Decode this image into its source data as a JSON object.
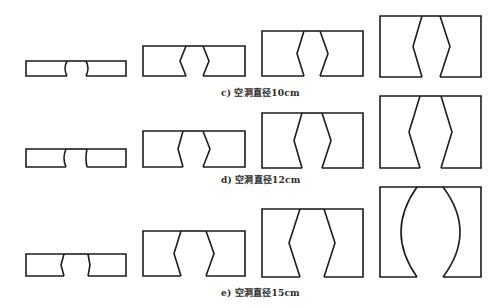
{
  "figure": {
    "stroke_color": "#1c1c1c",
    "background": "#ffffff",
    "rows": [
      {
        "id": "c",
        "caption": "c) 空洞直径10cm",
        "caption_pos": {
          "x": 221,
          "y": 87
        },
        "shapes": [
          {
            "x1": 26,
            "x2": 126,
            "top": 61,
            "bottom": 76,
            "left_gap": [
              67,
              65,
              67
            ],
            "right_gap": [
              86,
              88,
              86
            ],
            "curved": true
          },
          {
            "x1": 143,
            "x2": 245,
            "top": 46,
            "bottom": 76,
            "left_gap": [
              186,
              180,
              186
            ],
            "right_gap": [
              203,
              209,
              203
            ],
            "curved": false
          },
          {
            "x1": 262,
            "x2": 363,
            "top": 31,
            "bottom": 76,
            "left_gap": [
              304,
              297,
              304
            ],
            "right_gap": [
              320,
              328,
              320
            ],
            "curved": false
          },
          {
            "x1": 380,
            "x2": 481,
            "top": 16,
            "bottom": 77,
            "left_gap": [
              422,
              413,
              422
            ],
            "right_gap": [
              440,
              450,
              440
            ],
            "curved": false
          }
        ]
      },
      {
        "id": "d",
        "caption": "d) 空洞直径12cm",
        "caption_pos": {
          "x": 221,
          "y": 174
        },
        "shapes": [
          {
            "x1": 26,
            "x2": 126,
            "top": 149,
            "bottom": 167,
            "left_gap": [
              66,
              64,
              66
            ],
            "right_gap": [
              87,
              86,
              87
            ],
            "curved": true
          },
          {
            "x1": 143,
            "x2": 245,
            "top": 131,
            "bottom": 167,
            "left_gap": [
              183,
              178,
              183
            ],
            "right_gap": [
              203,
              210,
              203
            ],
            "curved": false
          },
          {
            "x1": 262,
            "x2": 363,
            "top": 113,
            "bottom": 168,
            "left_gap": [
              302,
              294,
              302
            ],
            "right_gap": [
              322,
              331,
              322
            ],
            "curved": false
          },
          {
            "x1": 380,
            "x2": 481,
            "top": 96,
            "bottom": 168,
            "left_gap": [
              420,
              409,
              420
            ],
            "right_gap": [
              441,
              452,
              441
            ],
            "curved": false
          }
        ]
      },
      {
        "id": "e",
        "caption": "e) 空洞直径15cm",
        "caption_pos": {
          "x": 221,
          "y": 287
        },
        "shapes": [
          {
            "x1": 26,
            "x2": 126,
            "top": 254,
            "bottom": 276,
            "left_gap": [
              64,
              61,
              64
            ],
            "right_gap": [
              88,
              90,
              88
            ],
            "curved": false
          },
          {
            "x1": 143,
            "x2": 245,
            "top": 231,
            "bottom": 276,
            "left_gap": [
              181,
              174,
              181
            ],
            "right_gap": [
              206,
              214,
              206
            ],
            "curved": false
          },
          {
            "x1": 262,
            "x2": 363,
            "top": 209,
            "bottom": 277,
            "left_gap": [
              300,
              289,
              300
            ],
            "right_gap": [
              324,
              335,
              324
            ],
            "curved": false
          },
          {
            "x1": 380,
            "x2": 481,
            "top": 187,
            "bottom": 277,
            "left_gap": [
              417,
              401,
              417
            ],
            "right_gap": [
              443,
              460,
              443
            ],
            "curved": true
          }
        ]
      }
    ]
  }
}
